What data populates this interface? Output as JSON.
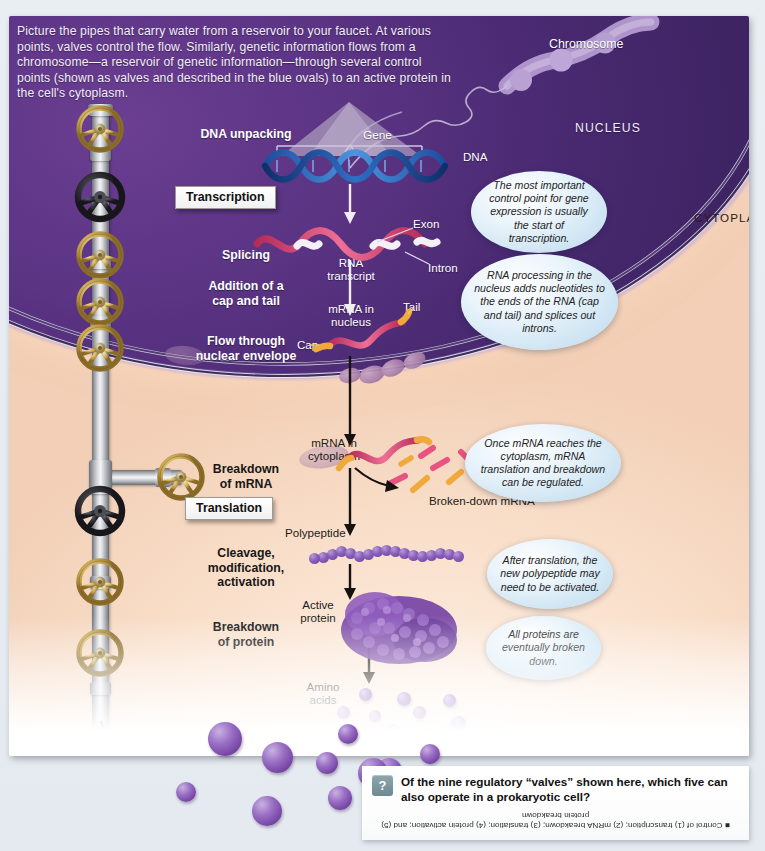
{
  "figure": {
    "intro": "Picture the pipes that carry water from a reservoir to your faucet. At various points, valves control the flow.  Similarly, genetic information flows from a chromosome—a reservoir of genetic information—through several control points (shown as valves and described in the blue ovals) to an active protein in the cell's cytoplasm.",
    "compartments": {
      "nucleus": "NUCLEUS",
      "cytoplasm": "CYTOPLASM"
    },
    "stages": [
      {
        "label": "DNA unpacking",
        "boxed": false,
        "theme": "light"
      },
      {
        "label": "Transcription",
        "boxed": true,
        "theme": "light"
      },
      {
        "label": "Splicing",
        "boxed": false,
        "theme": "light"
      },
      {
        "label": "Addition of a\ncap and tail",
        "boxed": false,
        "theme": "light"
      },
      {
        "label": "Flow through\nnuclear envelope",
        "boxed": false,
        "theme": "light"
      },
      {
        "label": "Breakdown\nof mRNA",
        "boxed": false,
        "theme": "dark"
      },
      {
        "label": "Translation",
        "boxed": true,
        "theme": "dark"
      },
      {
        "label": "Cleavage,\nmodification,\nactivation",
        "boxed": false,
        "theme": "dark"
      },
      {
        "label": "Breakdown\nof protein",
        "boxed": false,
        "theme": "dark"
      }
    ],
    "molecule_labels": {
      "chromosome": "Chromosome",
      "gene": "Gene",
      "dna": "DNA",
      "exon": "Exon",
      "intron": "Intron",
      "rna_transcript": "RNA\ntranscript",
      "mrna_nucleus": "mRNA in\nnucleus",
      "cap": "Cap",
      "tail": "Tail",
      "mrna_cytoplasm": "mRNA in\ncytoplasm",
      "broken_down_mrna": "Broken-down mRNA",
      "polypeptide": "Polypeptide",
      "active_protein": "Active\nprotein",
      "amino_acids": "Amino\nacids"
    },
    "callouts": [
      "The most important control point for gene expression is usually the start of transcription.",
      "RNA processing in the nucleus adds nucleotides to the ends of the RNA (cap and tail) and splices out introns.",
      "Once mRNA reaches the cytoplasm, mRNA translation and breakdown can be regulated.",
      "After translation, the new polypeptide may need to be activated.",
      "All proteins are eventually broken down."
    ],
    "valves": {
      "open_color": "#c9a352",
      "closed_color": "#2b2b2f",
      "count": 9
    },
    "colors": {
      "nucleus": "#5b3484",
      "cytoplasm": "#f4b172",
      "callout": "#cfe5f3",
      "dna_strand": "#2f6fc4",
      "rna_strand": "#e0537f",
      "protein": "#7a49a8"
    }
  },
  "question_strip": {
    "icon": "question-mark-icon",
    "icon_glyph": "?",
    "question": "Of the nine regulatory “valves” shown here, which five can also operate in a prokaryotic cell?",
    "answer": "■ Control of (1) transcription; (2) mRNA breakdown; (3) translation; (4) protein activation; and (5) protein breakdown"
  }
}
